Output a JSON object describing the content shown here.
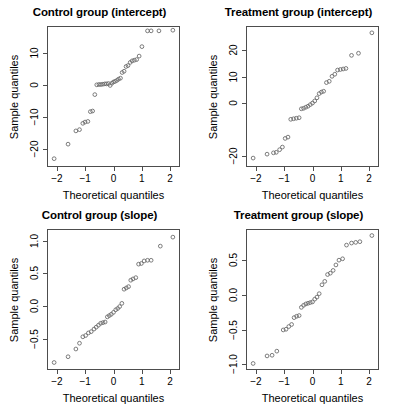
{
  "figure": {
    "width": 398,
    "height": 407,
    "background": "#ffffff",
    "point_color": "#6b6b6b",
    "axis_color": "#4d4d4d",
    "layout": "2x2 grid of Q-Q plots"
  },
  "chart_data": [
    {
      "type": "scatter",
      "title": "Control group (intercept)",
      "xlabel": "Theoretical quantiles",
      "ylabel": "Sample quantiles",
      "xticks": [
        -2,
        -1,
        0,
        1,
        2
      ],
      "yticks": [
        -20,
        -10,
        0,
        10
      ],
      "xlim": [
        -2.35,
        2.35
      ],
      "ylim": [
        -25.5,
        18.5
      ],
      "grid": false,
      "legend": false,
      "x": [
        -2.13,
        -1.63,
        -1.35,
        -1.22,
        -1.1,
        -1.02,
        -0.92,
        -0.83,
        -0.75,
        -0.67,
        -0.6,
        -0.52,
        -0.45,
        -0.38,
        -0.31,
        -0.25,
        -0.18,
        -0.12,
        -0.06,
        0.0,
        0.06,
        0.12,
        0.18,
        0.25,
        0.31,
        0.38,
        0.45,
        0.52,
        0.6,
        0.67,
        0.75,
        0.83,
        0.92,
        1.02,
        1.22,
        1.35,
        1.63,
        2.13
      ],
      "y": [
        -23.2,
        -18.6,
        -14.4,
        -14.0,
        -12.0,
        -11.6,
        -11.4,
        -8.3,
        -8.1,
        -2.9,
        0.2,
        0.3,
        0.3,
        0.4,
        0.5,
        0.5,
        0.6,
        0.0,
        0.7,
        1.1,
        1.3,
        1.6,
        2.0,
        2.3,
        4.1,
        4.5,
        6.0,
        6.3,
        7.3,
        7.8,
        8.0,
        8.2,
        9.3,
        12.3,
        17.3,
        17.3,
        17.3,
        17.5
      ]
    },
    {
      "type": "scatter",
      "title": "Treatment group (intercept)",
      "xlabel": "Theoretical quantiles",
      "ylabel": "Sample quantiles",
      "xticks": [
        -2,
        -1,
        0,
        1,
        2
      ],
      "yticks": [
        -20,
        0,
        10,
        20
      ],
      "xlim": [
        -2.35,
        2.35
      ],
      "ylim": [
        -24.0,
        29.0
      ],
      "grid": false,
      "legend": false,
      "x": [
        -2.13,
        -1.63,
        -1.4,
        -1.3,
        -1.18,
        -1.08,
        -0.98,
        -0.88,
        -0.78,
        -0.68,
        -0.58,
        -0.48,
        -0.4,
        -0.32,
        -0.24,
        -0.16,
        -0.08,
        0.0,
        0.08,
        0.16,
        0.24,
        0.32,
        0.4,
        0.5,
        0.6,
        0.7,
        0.8,
        0.9,
        1.0,
        1.1,
        1.2,
        1.4,
        1.65,
        2.13
      ],
      "y": [
        -21.0,
        -19.5,
        -19.0,
        -18.8,
        -17.8,
        -16.8,
        -13.5,
        -13.0,
        -6.2,
        -6.0,
        -5.8,
        -5.6,
        -2.2,
        -2.0,
        -1.6,
        -1.2,
        -0.6,
        0.0,
        0.8,
        2.0,
        3.6,
        4.2,
        4.5,
        7.8,
        8.3,
        10.2,
        11.0,
        12.6,
        12.8,
        13.0,
        13.2,
        18.2,
        19.0,
        26.8
      ]
    },
    {
      "type": "scatter",
      "title": "Control group (slope)",
      "xlabel": "Theoretical quantiles",
      "ylabel": "Sample quantiles",
      "xticks": [
        -2,
        -1,
        0,
        1,
        2
      ],
      "yticks": [
        -0.5,
        0.0,
        0.5,
        1.0
      ],
      "xlim": [
        -2.35,
        2.35
      ],
      "ylim": [
        -0.98,
        1.18
      ],
      "grid": false,
      "legend": false,
      "x": [
        -2.13,
        -1.63,
        -1.35,
        -1.22,
        -1.1,
        -1.0,
        -0.9,
        -0.8,
        -0.7,
        -0.62,
        -0.54,
        -0.46,
        -0.38,
        -0.3,
        -0.22,
        -0.15,
        -0.08,
        0.0,
        0.08,
        0.15,
        0.22,
        0.3,
        0.38,
        0.46,
        0.54,
        0.62,
        0.7,
        0.8,
        0.9,
        1.0,
        1.1,
        1.22,
        1.35,
        1.68,
        2.13
      ],
      "y": [
        -0.88,
        -0.79,
        -0.67,
        -0.58,
        -0.48,
        -0.46,
        -0.42,
        -0.4,
        -0.36,
        -0.33,
        -0.3,
        -0.27,
        -0.26,
        -0.25,
        -0.17,
        -0.15,
        -0.13,
        -0.1,
        -0.06,
        -0.04,
        -0.01,
        0.04,
        0.26,
        0.28,
        0.3,
        0.4,
        0.42,
        0.44,
        0.65,
        0.66,
        0.7,
        0.71,
        0.71,
        0.93,
        1.07
      ]
    },
    {
      "type": "scatter",
      "title": "Treatment group (slope)",
      "xlabel": "Theoretical quantiles",
      "ylabel": "Sample quantiles",
      "xticks": [
        -2,
        -1,
        0,
        1,
        2
      ],
      "yticks": [
        -1.0,
        -0.5,
        0.0,
        0.5
      ],
      "xlim": [
        -2.35,
        2.35
      ],
      "ylim": [
        -1.08,
        0.95
      ],
      "grid": false,
      "legend": false,
      "x": [
        -2.13,
        -1.63,
        -1.45,
        -1.28,
        -1.05,
        -0.95,
        -0.85,
        -0.75,
        -0.66,
        -0.57,
        -0.48,
        -0.4,
        -0.32,
        -0.24,
        -0.16,
        -0.08,
        0.0,
        0.08,
        0.16,
        0.24,
        0.34,
        0.44,
        0.54,
        0.64,
        0.74,
        0.84,
        0.95,
        1.08,
        1.22,
        1.4,
        1.55,
        1.7,
        2.13
      ],
      "y": [
        -1.0,
        -0.89,
        -0.88,
        -0.82,
        -0.51,
        -0.5,
        -0.46,
        -0.43,
        -0.33,
        -0.31,
        -0.3,
        -0.18,
        -0.15,
        -0.13,
        -0.12,
        -0.11,
        -0.1,
        -0.06,
        -0.03,
        0.02,
        0.15,
        0.2,
        0.3,
        0.32,
        0.36,
        0.44,
        0.51,
        0.53,
        0.73,
        0.76,
        0.77,
        0.78,
        0.87
      ]
    }
  ]
}
